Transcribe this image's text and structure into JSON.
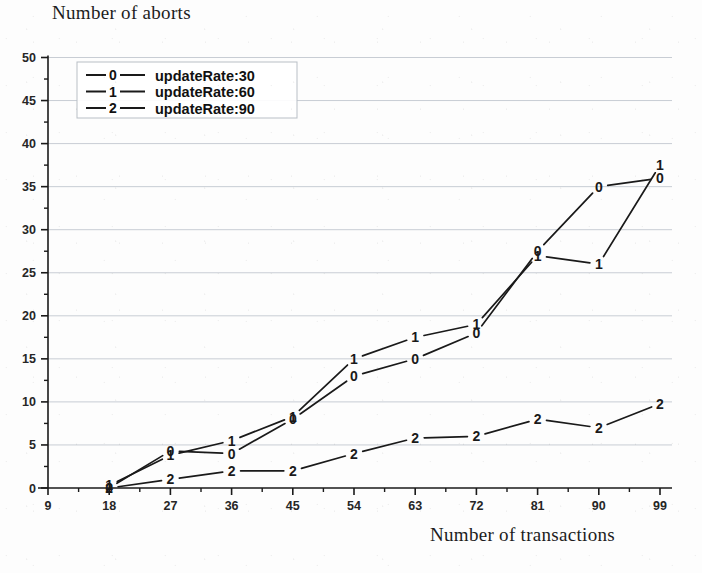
{
  "chart_data": {
    "type": "line",
    "title": "Number of aborts",
    "xlabel": "Number of transactions",
    "ylabel": "Number of aborts",
    "xlim": [
      9,
      99
    ],
    "ylim": [
      0,
      50
    ],
    "xticks": [
      9,
      18,
      27,
      36,
      45,
      54,
      63,
      72,
      81,
      90,
      99
    ],
    "yticks": [
      0,
      5,
      10,
      15,
      20,
      25,
      30,
      35,
      40,
      45,
      50
    ],
    "grid": true,
    "legend_position": "upper left",
    "x": [
      18,
      27,
      36,
      45,
      54,
      63,
      72,
      81,
      90,
      99
    ],
    "series": [
      {
        "name": "updateRate:30",
        "marker": "0",
        "values": [
          0,
          4.3,
          4.0,
          8.0,
          13.0,
          15.0,
          18.0,
          27.5,
          35.0,
          36.0
        ]
      },
      {
        "name": "updateRate:60",
        "marker": "1",
        "values": [
          0.3,
          3.8,
          5.5,
          8.3,
          15.0,
          17.5,
          19.0,
          27.0,
          26.0,
          37.5
        ]
      },
      {
        "name": "updateRate:90",
        "marker": "2",
        "values": [
          0,
          1.0,
          2.0,
          2.0,
          4.0,
          5.8,
          6.0,
          8.0,
          7.0,
          9.8
        ]
      }
    ]
  },
  "legend": {
    "entries": [
      {
        "marker": "0",
        "label": "updateRate:30"
      },
      {
        "marker": "1",
        "label": "updateRate:60"
      },
      {
        "marker": "2",
        "label": "updateRate:90"
      }
    ]
  },
  "axes": {
    "y_tick_labels": [
      "50",
      "45",
      "40",
      "35",
      "30",
      "25",
      "20",
      "15",
      "10",
      "5",
      "0"
    ],
    "x_tick_labels": [
      "9",
      "18",
      "27",
      "36",
      "45",
      "54",
      "63",
      "72",
      "81",
      "90",
      "99"
    ]
  },
  "colors": {
    "line": "#1a1a1a",
    "grid": "#c8cdd4",
    "axis": "#1a1a1a",
    "text": "#1c1c1c",
    "background": "#fdfdfd"
  }
}
